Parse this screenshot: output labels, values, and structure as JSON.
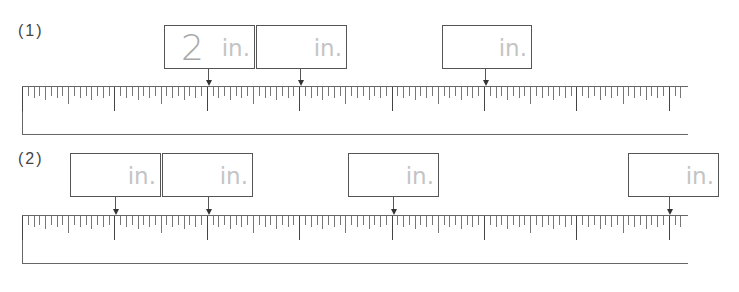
{
  "problems": [
    {
      "label": "(1)",
      "ruler": {
        "left": 22,
        "top": 86,
        "width": 666,
        "height": 49,
        "inch_px": 92.4,
        "divisions_per_inch": 16
      },
      "boxes": [
        {
          "left": 164,
          "top": 25,
          "width": 91,
          "answer": "2",
          "unit": "in.",
          "arrow_x": 208
        },
        {
          "left": 256,
          "top": 25,
          "width": 91,
          "answer": "",
          "unit": "in.",
          "arrow_x": 300
        },
        {
          "left": 442,
          "top": 25,
          "width": 90,
          "answer": "",
          "unit": "in.",
          "arrow_x": 485
        }
      ]
    },
    {
      "label": "(2)",
      "ruler": {
        "left": 22,
        "top": 215,
        "width": 666,
        "height": 49,
        "inch_px": 92.4,
        "divisions_per_inch": 16
      },
      "boxes": [
        {
          "left": 70,
          "top": 153,
          "width": 91,
          "answer": "",
          "unit": "in.",
          "arrow_x": 115
        },
        {
          "left": 162,
          "top": 153,
          "width": 91,
          "answer": "",
          "unit": "in.",
          "arrow_x": 208
        },
        {
          "left": 348,
          "top": 153,
          "width": 91,
          "answer": "",
          "unit": "in.",
          "arrow_x": 393
        },
        {
          "left": 628,
          "top": 153,
          "width": 91,
          "answer": "",
          "unit": "in.",
          "arrow_x": 669
        }
      ]
    }
  ],
  "colors": {
    "box_border": "#555555",
    "answer_text": "#a8a8a8",
    "unit_text": "#c4c4c4",
    "ruler_line": "#666666"
  }
}
